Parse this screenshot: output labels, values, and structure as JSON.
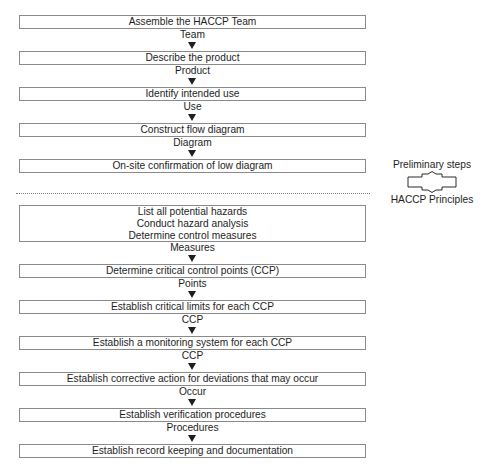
{
  "diagram": {
    "title": "",
    "preliminary_steps": [
      {
        "label": "Assemble the HACCP Team",
        "connector": "Team"
      },
      {
        "label": "Describe the product",
        "connector": "Product"
      },
      {
        "label": "Identify intended use",
        "connector": "Use"
      },
      {
        "label": "Construct flow diagram",
        "connector": "Diagram"
      },
      {
        "label": "On-site confirmation of low diagram",
        "connector": ""
      }
    ],
    "principles": [
      {
        "lines": [
          "List all potential hazards",
          "Conduct hazard analysis",
          "Determine control measures"
        ],
        "connector": "Measures"
      },
      {
        "lines": [
          "Determine critical control points (CCP)"
        ],
        "connector": "Points"
      },
      {
        "lines": [
          "Establish critical limits for each CCP"
        ],
        "connector": "CCP"
      },
      {
        "lines": [
          "Establish a monitoring system for each CCP"
        ],
        "connector": "CCP"
      },
      {
        "lines": [
          "Establish corrective action for deviations that may occur"
        ],
        "connector": "Occur"
      },
      {
        "lines": [
          "Establish verification procedures"
        ],
        "connector": "Procedures"
      },
      {
        "lines": [
          "Establish record keeping and documentation"
        ],
        "connector": ""
      }
    ],
    "legend": {
      "top_label": "Preliminary steps",
      "bottom_label": "HACCP Principles",
      "icon": "up-down-block-arrow-icon"
    },
    "colors": {
      "text": "#1e1e1e",
      "box_border": "#8a8a8a",
      "divider": "#7a7a7a",
      "background": "#ffffff"
    }
  }
}
